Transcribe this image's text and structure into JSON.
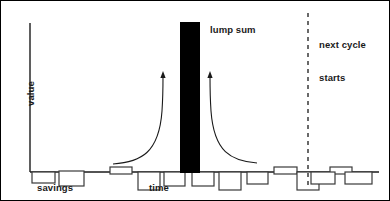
{
  "figure": {
    "type": "diagram"
  },
  "axes": {
    "y_label": "value",
    "x_label": "time",
    "y_axis": {
      "x": 29,
      "y_top": 22,
      "y_bottom": 171
    },
    "x_axis": {
      "y": 171,
      "x_start": 29,
      "x_end": 378
    }
  },
  "labels": {
    "lump_sum": "lump sum",
    "next_cycle": "next cycle\nstarts",
    "next_cycle_line1": "next cycle",
    "next_cycle_line2": "starts",
    "savings": "savings",
    "time": "time",
    "value": "value"
  },
  "colors": {
    "stroke": "#1a1a1a",
    "bar_fill": "#000000",
    "background": "#ffffff",
    "box_stroke": "#3a3a3a"
  },
  "lump_sum_bar": {
    "x": 179,
    "y": 21,
    "width": 20,
    "height": 151
  },
  "dashed_line": {
    "x": 307,
    "y_top": 12,
    "y_bottom": 188,
    "dash": "4 4"
  },
  "arrows": [
    {
      "name": "left-curved-arrow",
      "path": "M 112 163 C 140 161 158 152 161 110 C 162 95 162 82 162 75",
      "tip": [
        162,
        71
      ]
    },
    {
      "name": "right-curved-arrow",
      "path": "M 256 162 C 230 160 213 151 210 110 C 209 95 209 82 209 75",
      "tip": [
        209,
        71
      ]
    }
  ],
  "savings_boxes": [
    {
      "x": 31,
      "y": 171,
      "w": 23,
      "h": 11,
      "side": "below"
    },
    {
      "x": 58,
      "y": 170,
      "w": 25,
      "h": 15,
      "side": "below"
    },
    {
      "x": 109,
      "y": 166,
      "w": 22,
      "h": 7,
      "side": "above"
    },
    {
      "x": 137,
      "y": 171,
      "w": 22,
      "h": 18,
      "side": "below"
    },
    {
      "x": 163,
      "y": 171,
      "w": 21,
      "h": 14,
      "side": "below"
    },
    {
      "x": 191,
      "y": 171,
      "w": 22,
      "h": 14,
      "side": "below"
    },
    {
      "x": 218,
      "y": 171,
      "w": 22,
      "h": 18,
      "side": "below"
    },
    {
      "x": 246,
      "y": 171,
      "w": 21,
      "h": 12,
      "side": "below"
    },
    {
      "x": 273,
      "y": 166,
      "w": 23,
      "h": 7,
      "side": "above"
    },
    {
      "x": 296,
      "y": 171,
      "w": 22,
      "h": 18,
      "side": "below"
    },
    {
      "x": 329,
      "y": 166,
      "w": 22,
      "h": 7,
      "side": "above"
    },
    {
      "x": 310,
      "y": 171,
      "w": 24,
      "h": 12,
      "side": "below"
    },
    {
      "x": 344,
      "y": 171,
      "w": 27,
      "h": 12,
      "side": "below"
    }
  ],
  "text_positions": {
    "lump_sum": {
      "left": 209,
      "top": 23
    },
    "next_cycle": {
      "left": 318,
      "top": 16
    },
    "savings": {
      "left": 36,
      "top": 181
    },
    "time": {
      "left": 148,
      "top": 181
    },
    "value": {
      "left": 24,
      "top": 88
    }
  }
}
